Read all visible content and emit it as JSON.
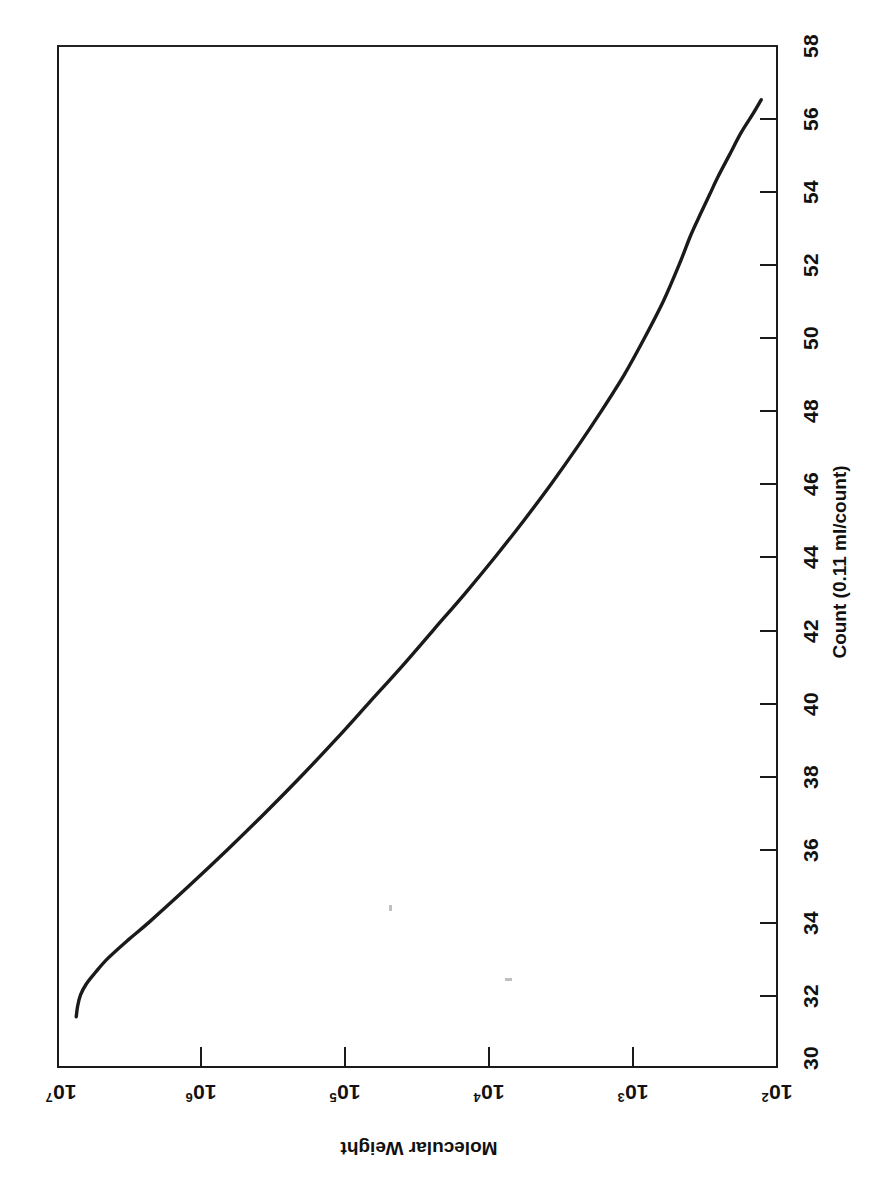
{
  "figure": {
    "background": "#ffffff",
    "ink_color": "#1a1a1a",
    "orientation_note": "landscape plot printed rotated 90 degrees"
  },
  "chart_data": {
    "type": "line",
    "title": "",
    "subtitle": "",
    "orientation": "rotated-90",
    "xlabel": "Count (0.11 ml/count)",
    "ylabel": "Molecular Weight",
    "xlim": [
      30,
      58
    ],
    "ylim_log10": [
      2,
      7
    ],
    "ylim": [
      100,
      10000000
    ],
    "y_scale": "log",
    "x_scale": "linear",
    "grid": false,
    "legend": null,
    "annotations": [],
    "x_ticks": [
      30,
      32,
      34,
      36,
      38,
      40,
      42,
      44,
      46,
      48,
      50,
      52,
      54,
      56,
      58
    ],
    "x_tick_labels": [
      "30",
      "32",
      "34",
      "36",
      "38",
      "40",
      "42",
      "44",
      "46",
      "48",
      "50",
      "52",
      "54",
      "56",
      "58"
    ],
    "y_ticks": [
      10000000,
      1000000,
      100000,
      10000,
      1000,
      100
    ],
    "y_tick_labels": [
      "10⁷",
      "10⁶",
      "10⁵",
      "10⁴",
      "10³",
      "10²"
    ],
    "y_tick_mantissa": [
      "10",
      "10",
      "10",
      "10",
      "10",
      "10"
    ],
    "y_tick_exponent": [
      "7",
      "6",
      "5",
      "4",
      "3",
      "2"
    ],
    "series": [
      {
        "name": "calibration curve",
        "color": "#1a1a1a",
        "line_width": 3,
        "x": [
          31.4,
          31.7,
          32.0,
          32.3,
          32.6,
          33.0,
          33.5,
          34.0,
          35.0,
          36.0,
          37.0,
          38.0,
          39.0,
          40.0,
          41.0,
          42.0,
          43.0,
          44.0,
          45.0,
          46.0,
          47.0,
          48.0,
          49.0,
          50.0,
          51.0,
          52.0,
          52.8,
          53.4,
          53.9,
          54.4,
          55.0,
          55.6,
          56.1,
          56.5
        ],
        "y_log10": [
          6.88,
          6.87,
          6.85,
          6.81,
          6.75,
          6.66,
          6.52,
          6.37,
          6.09,
          5.82,
          5.56,
          5.31,
          5.07,
          4.84,
          4.61,
          4.39,
          4.17,
          3.96,
          3.76,
          3.57,
          3.39,
          3.22,
          3.06,
          2.92,
          2.79,
          2.68,
          2.6,
          2.53,
          2.47,
          2.41,
          2.33,
          2.25,
          2.17,
          2.11
        ],
        "y": [
          7586000,
          7413000,
          7079000,
          6457000,
          5623000,
          4571000,
          3311000,
          2344000,
          1230000,
          661000,
          363000,
          204000,
          117500,
          69200,
          40700,
          24500,
          14800,
          9120,
          5750,
          3715,
          2455,
          1660,
          1148,
          832,
          617,
          479,
          398,
          339,
          295,
          257,
          214,
          178,
          148,
          129
        ]
      }
    ]
  },
  "axes": {
    "count": {
      "title": "Count (0.11 ml/count)",
      "min": 30,
      "max": 58,
      "tick_step": 2,
      "labels": [
        "58",
        "56",
        "54",
        "52",
        "50",
        "48",
        "46",
        "44",
        "42",
        "40",
        "38",
        "36",
        "34",
        "32",
        "30"
      ]
    },
    "molecular_weight": {
      "title": "Molecular Weight",
      "labels": [
        {
          "mantissa": "10",
          "exponent": "7"
        },
        {
          "mantissa": "10",
          "exponent": "6"
        },
        {
          "mantissa": "10",
          "exponent": "5"
        },
        {
          "mantissa": "10",
          "exponent": "4"
        },
        {
          "mantissa": "10",
          "exponent": "3"
        },
        {
          "mantissa": "10",
          "exponent": "2"
        }
      ]
    }
  }
}
